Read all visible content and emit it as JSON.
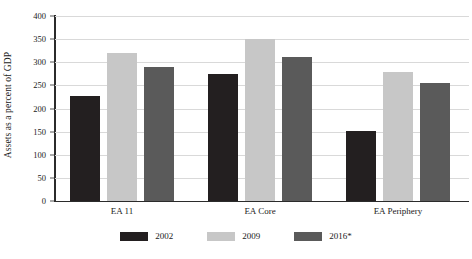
{
  "chart_data": {
    "type": "bar",
    "title": "",
    "xlabel": "",
    "ylabel": "Assets as a percent of GDP",
    "categories": [
      "EA 11",
      "EA Core",
      "EA Periphery"
    ],
    "series": [
      {
        "name": "2002",
        "color": "#231f20",
        "values": [
          226,
          275,
          152
        ]
      },
      {
        "name": "2009",
        "color": "#c7c7c7",
        "values": [
          320,
          350,
          278
        ]
      },
      {
        "name": "2016*",
        "color": "#5a5a5a",
        "values": [
          290,
          311,
          256
        ]
      }
    ],
    "ylim": [
      0,
      400
    ],
    "y_ticks": [
      0,
      50,
      100,
      150,
      200,
      250,
      300,
      350,
      400
    ],
    "y_tick_labels": [
      "0",
      "50",
      "100",
      "150",
      "200",
      "250",
      "300",
      "350",
      "400"
    ],
    "grid": true,
    "legend_position": "bottom"
  },
  "legend": {
    "items": [
      {
        "label": "2002"
      },
      {
        "label": "2009"
      },
      {
        "label": "2016*"
      }
    ]
  }
}
